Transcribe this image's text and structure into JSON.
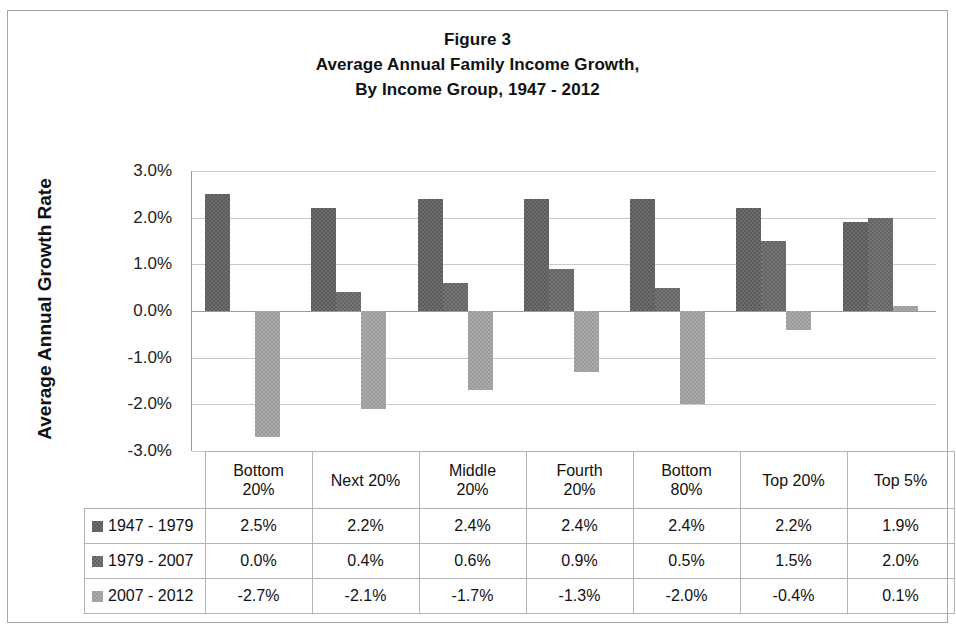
{
  "figure": {
    "title_lines": [
      "Figure 3",
      "Average Annual Family Income Growth,",
      "By Income Group, 1947 - 2012"
    ],
    "ylabel": "Average Annual Growth Rate"
  },
  "chart_data": {
    "type": "bar",
    "xlabel": "",
    "ylabel": "Average Annual Growth Rate",
    "ylim": [
      -3.0,
      3.0
    ],
    "ytick_labels": [
      "3.0%",
      "2.0%",
      "1.0%",
      "0.0%",
      "-1.0%",
      "-2.0%",
      "-3.0%"
    ],
    "ytick_values": [
      3.0,
      2.0,
      1.0,
      0.0,
      -1.0,
      -2.0,
      -3.0
    ],
    "grid": true,
    "legend_position": "table-row-headers",
    "units": "percent",
    "categories": [
      "Bottom 20%",
      "Next 20%",
      "Middle 20%",
      "Fourth 20%",
      "Bottom 80%",
      "Top 20%",
      "Top 5%"
    ],
    "category_label_lines": [
      [
        "Bottom",
        "20%"
      ],
      [
        "Next 20%",
        ""
      ],
      [
        "Middle",
        "20%"
      ],
      [
        "Fourth",
        "20%"
      ],
      [
        "Bottom",
        "80%"
      ],
      [
        "Top 20%",
        ""
      ],
      [
        "Top 5%",
        ""
      ]
    ],
    "series": [
      {
        "name": "1947 - 1979",
        "color": "#6e6e6e",
        "values": [
          2.5,
          2.2,
          2.4,
          2.4,
          2.4,
          2.2,
          1.9
        ],
        "labels": [
          "2.5%",
          "2.2%",
          "2.4%",
          "2.4%",
          "2.4%",
          "2.2%",
          "1.9%"
        ]
      },
      {
        "name": "1979 - 2007",
        "color": "#767676",
        "values": [
          0.0,
          0.4,
          0.6,
          0.9,
          0.5,
          1.5,
          2.0
        ],
        "labels": [
          "0.0%",
          "0.4%",
          "0.6%",
          "0.9%",
          "0.5%",
          "1.5%",
          "2.0%"
        ]
      },
      {
        "name": "2007 - 2012",
        "color": "#ababab",
        "values": [
          -2.7,
          -2.1,
          -1.7,
          -1.3,
          -2.0,
          -0.4,
          0.1
        ],
        "labels": [
          "-2.7%",
          "-2.1%",
          "-1.7%",
          "-1.3%",
          "-2.0%",
          "-0.4%",
          "0.1%"
        ]
      }
    ]
  }
}
